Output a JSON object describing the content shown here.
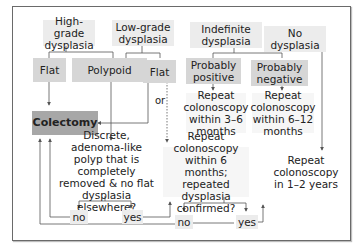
{
  "diagram": {
    "type": "flowchart",
    "categories": {
      "high_grade": "High-grade dysplasia",
      "low_grade": "Low-grade dysplasia",
      "indefinite": "Indefinite dysplasia",
      "none": "No dysplasia"
    },
    "subtypes": {
      "hg_flat": "Flat",
      "polypoid": "Polypoid",
      "lg_flat": "Flat",
      "probably_positive": "Probably positive",
      "probably_negative": "Probably negative"
    },
    "actions": {
      "colectomy": "Colectomy",
      "repeat_3_6": "Repeat colonoscopy within 3–6 months",
      "repeat_6_12": "Repeat colonoscopy within 6–12 months",
      "repeat_1_2y": "Repeat colonoscopy in 1–2 years"
    },
    "questions": {
      "polyp": "Discrete, adenoma-like polyp that is completely removed & no flat dysplasia elsewhere?",
      "repeat6": "Repeat colonoscopy within 6 months; repeated dysplasia confirmed?"
    },
    "answers": {
      "polyp_no": "no",
      "polyp_yes": "yes",
      "repeat_no": "no",
      "repeat_yes": "yes"
    },
    "connector_label_or": "or",
    "colors": {
      "light_box": "#ececec",
      "mid_box": "#d6d6d6",
      "dark_box": "#a7a7a7",
      "line": "#555555"
    }
  }
}
